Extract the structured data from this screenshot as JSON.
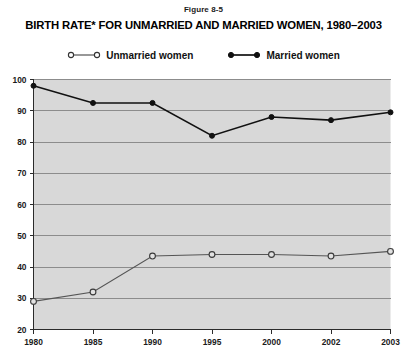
{
  "figure": {
    "number": "Figure 8-5",
    "title": "BIRTH RATE* FOR UNMARRIED AND MARRIED WOMEN, 1980–2003"
  },
  "legend": {
    "position": "top-center",
    "items": [
      {
        "label": "Unmarried women",
        "marker": "hollow-circle-icon",
        "color": "#555555"
      },
      {
        "label": "Married women",
        "marker": "filled-circle-icon",
        "color": "#111111"
      }
    ]
  },
  "axes": {
    "y_ticks": [
      "100",
      "90",
      "80",
      "70",
      "60",
      "50",
      "40",
      "30",
      "20"
    ],
    "x_ticks": [
      "1980",
      "1985",
      "1990",
      "1995",
      "2000",
      "2002",
      "2003"
    ]
  },
  "colors": {
    "plot_background": "#d8d8d8",
    "gridline": "#8c8c8c",
    "axis": "#2b2b2b",
    "married": "#111111",
    "unmarried": "#555555"
  },
  "chart_data": {
    "type": "line",
    "title": "BIRTH RATE* FOR UNMARRIED AND MARRIED WOMEN, 1980–2003",
    "xlabel": "",
    "ylabel": "",
    "categories": [
      "1980",
      "1985",
      "1990",
      "1995",
      "2000",
      "2002",
      "2003"
    ],
    "series": [
      {
        "name": "Unmarried women",
        "values": [
          29,
          32,
          43.5,
          44,
          44,
          43.5,
          45
        ]
      },
      {
        "name": "Married women",
        "values": [
          98,
          92.5,
          92.5,
          82,
          88,
          87,
          89.5
        ]
      }
    ],
    "ylim": [
      20,
      100
    ],
    "ytick_interval": 10,
    "grid": true,
    "legend_position": "top-center"
  }
}
